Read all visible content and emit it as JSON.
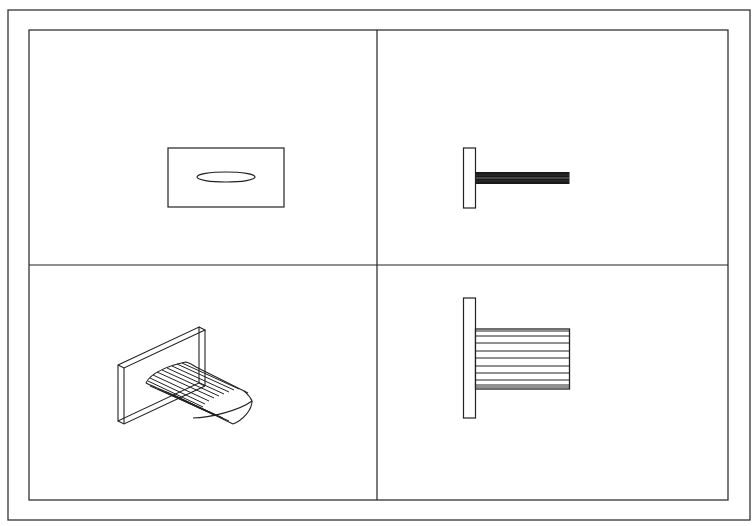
{
  "figure": {
    "type": "four-view engineering drawing",
    "background": "#ffffff",
    "line_color": "#222222",
    "panels": [
      {
        "id": "top-left",
        "view": "front view",
        "content": "rectangular plate with elliptical blade cross-section"
      },
      {
        "id": "top-right",
        "view": "top view",
        "content": "plate edge with thin blade projecting right"
      },
      {
        "id": "bottom-left",
        "view": "isometric view",
        "content": "wireframe plate with curved blade surface"
      },
      {
        "id": "bottom-right",
        "view": "side view",
        "content": "plate edge with blade showing spanwise section lines"
      }
    ]
  }
}
